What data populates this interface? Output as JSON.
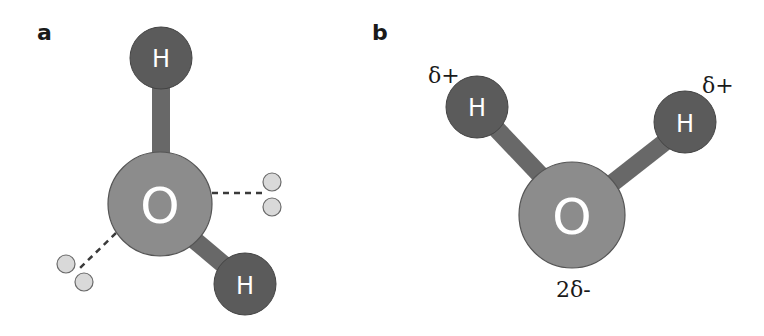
{
  "panels": [
    {
      "label": "a",
      "title": "Water molecule with hydrogen bonds",
      "atoms": [
        {
          "symbol": "H",
          "role": "hydrogen-top",
          "cx": 161,
          "cy": 58,
          "r": 31
        },
        {
          "symbol": "O",
          "role": "oxygen",
          "cx": 160,
          "cy": 204,
          "r": 52
        },
        {
          "symbol": "H",
          "role": "hydrogen-bottom-right",
          "cx": 245,
          "cy": 284,
          "r": 31
        }
      ],
      "lone_pairs": [
        {
          "side": "right",
          "dots": [
            [
              272,
              182
            ],
            [
              272,
              207
            ]
          ]
        },
        {
          "side": "lower-left",
          "dots": [
            [
              66,
              263
            ],
            [
              84,
              281
            ]
          ]
        }
      ]
    },
    {
      "label": "b",
      "title": "Water molecule partial charges",
      "atoms": [
        {
          "symbol": "H",
          "role": "hydrogen-left",
          "cx": 477,
          "cy": 107,
          "r": 31,
          "charge": "δ+"
        },
        {
          "symbol": "O",
          "role": "oxygen",
          "cx": 572,
          "cy": 215,
          "r": 53,
          "charge": "2δ-"
        },
        {
          "symbol": "H",
          "role": "hydrogen-right",
          "cx": 685,
          "cy": 122,
          "r": 31,
          "charge": "δ+"
        }
      ]
    }
  ],
  "colors": {
    "hydrogen": "#5b5b5b",
    "oxygen": "#8c8c8c",
    "bond": "#686868",
    "lone_pair": "#d9d9d9",
    "outline": "#4a4a4a"
  }
}
